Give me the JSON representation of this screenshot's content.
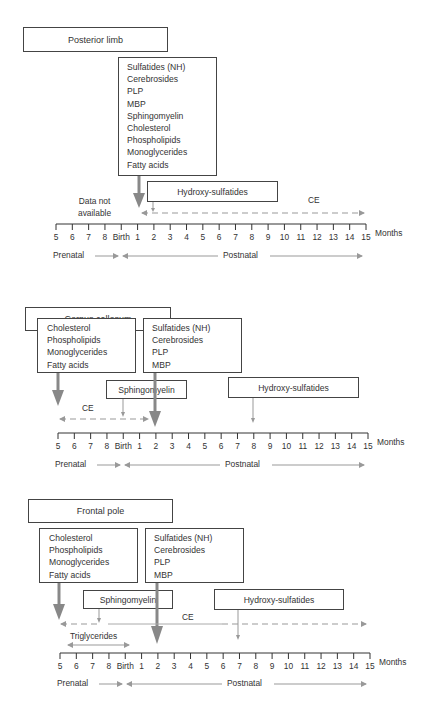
{
  "axis": {
    "ticks": [
      "5",
      "6",
      "7",
      "8",
      "Birth",
      "1",
      "2",
      "3",
      "4",
      "5",
      "6",
      "7",
      "8",
      "9",
      "10",
      "11",
      "12",
      "13",
      "14",
      "15"
    ],
    "unit": "Months",
    "prenatal_label": "Prenatal",
    "postnatal_label": "Postnatal"
  },
  "panels": [
    {
      "title": "Posterior limb",
      "main_box": [
        "Sulfatides (NH)",
        "Cerebrosides",
        "PLP",
        "MBP",
        "Sphingomyelin",
        "Cholesterol",
        "Phospholipids",
        "Monoglycerides",
        "Fatty acids"
      ],
      "hydroxy_label": "Hydroxy-sulfatides",
      "note": [
        "Data not",
        "available"
      ],
      "ce_label": "CE"
    },
    {
      "title": "Corpus callosum",
      "left_box": [
        "Cholesterol",
        "Phospholipids",
        "Monoglycerides",
        "Fatty acids"
      ],
      "right_box": [
        "Sulfatides (NH)",
        "Cerebrosides",
        "PLP",
        "MBP"
      ],
      "sphingo_label": "Sphingomyelin",
      "hydroxy_label": "Hydroxy-sulfatides",
      "ce_label": "CE"
    },
    {
      "title": "Frontal pole",
      "left_box": [
        "Cholesterol",
        "Phospholipids",
        "Monoglycerides",
        "Fatty acids"
      ],
      "right_box": [
        "Sulfatides (NH)",
        "Cerebrosides",
        "PLP",
        "MBP"
      ],
      "sphingo_label": "Sphingomyelin",
      "hydroxy_label": "Hydroxy-sulfatides",
      "ce_label": "CE",
      "tri_label": "Triglycerides"
    }
  ],
  "colors": {
    "arrow": "#8a8a8a",
    "line": "#333333",
    "dashed": "#999999"
  }
}
